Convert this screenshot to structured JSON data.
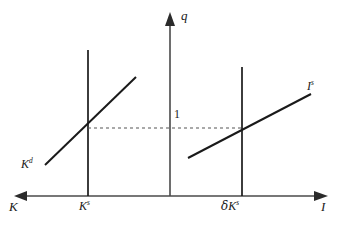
{
  "figure": {
    "type": "economics-diagram"
  },
  "axes": {
    "vertical": {
      "label": "q",
      "x": 170,
      "top_y": 15,
      "bottom_y": 196,
      "arrow": "up"
    },
    "horizontal_left": {
      "label": "K",
      "arrow": "left",
      "y": 196,
      "start_x": 15
    },
    "horizontal_right": {
      "label": "I",
      "arrow": "right",
      "y": 196,
      "end_x": 325
    }
  },
  "gridline": {
    "unit_label": "1",
    "dashed_y": 128,
    "dashed_x_start": 88,
    "dashed_x_end": 242
  },
  "curves": [
    {
      "name": "capital-demand",
      "label_main": "K",
      "label_sup": "d",
      "x1": 45,
      "y1": 165,
      "x2": 136,
      "y2": 77
    },
    {
      "name": "investment-supply",
      "label_main": "I",
      "label_sup": "s",
      "x1": 188,
      "y1": 158,
      "x2": 311,
      "y2": 94
    }
  ],
  "vertical_lines": [
    {
      "name": "capital-stock",
      "label_prefix": "",
      "label_main": "K",
      "label_sup": "s",
      "x": 88,
      "top_y": 50,
      "bottom_y": 196
    },
    {
      "name": "depreciation-replacement",
      "label_prefix": "δ",
      "label_main": "K",
      "label_sup": "s",
      "x": 242,
      "top_y": 67,
      "bottom_y": 196
    }
  ],
  "colors": {
    "axis": "#4a4a4a",
    "curve": "#1a1a1a",
    "dashed": "#555555",
    "background": "#ffffff"
  }
}
